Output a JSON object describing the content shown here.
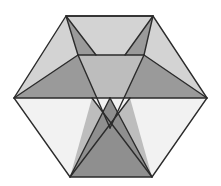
{
  "figure": {
    "name": "polyhedron-wireframe-figure",
    "canvas": {
      "width": 221,
      "height": 186,
      "background": "#ffffff"
    },
    "palette": {
      "outline": "#2b2b2b",
      "lightest": "#f2f2f2",
      "light": "#d3d3d3",
      "mid": "#bdbdbd",
      "medium": "#9a9a9a",
      "dark": "#8f8f8f"
    },
    "stroke_width": 1.4,
    "vertices": {
      "hex_top_left": [
        66,
        16
      ],
      "hex_top_right": [
        153,
        16
      ],
      "hex_right": [
        207,
        98
      ],
      "hex_bottom_right": [
        152,
        177
      ],
      "hex_bottom_left": [
        70,
        177
      ],
      "hex_left": [
        14,
        98
      ],
      "inner_top_left": [
        78,
        55
      ],
      "inner_top_right": [
        144,
        55
      ],
      "center_cross": [
        110,
        128
      ],
      "apex_low_left": [
        92,
        150
      ],
      "apex_low_right": [
        130,
        150
      ]
    },
    "facets": [
      {
        "name": "top-panel",
        "tone": "light",
        "points": "66,16 153,16 144,55 78,55"
      },
      {
        "name": "top-left-wedge",
        "tone": "medium",
        "points": "66,16 78,55 96,55"
      },
      {
        "name": "top-right-wedge",
        "tone": "medium",
        "points": "153,16 125,55 144,55"
      },
      {
        "name": "upper-left-face",
        "tone": "light",
        "points": "66,16 14,98 78,55"
      },
      {
        "name": "upper-right-face",
        "tone": "light",
        "points": "153,16 144,55 207,98"
      },
      {
        "name": "left-wing-triangle",
        "tone": "medium",
        "points": "14,98 78,55 110,98"
      },
      {
        "name": "right-wing-triangle",
        "tone": "medium",
        "points": "207,98 144,55 110,98"
      },
      {
        "name": "center-upper-triangle",
        "tone": "mid",
        "points": "78,55 144,55 110,128"
      },
      {
        "name": "lower-left-face",
        "tone": "lightest",
        "points": "14,98 110,98 70,177"
      },
      {
        "name": "lower-right-face",
        "tone": "lightest",
        "points": "207,98 110,98 152,177"
      },
      {
        "name": "left-cross-blade",
        "tone": "mid",
        "points": "92,98 130,150 70,177"
      },
      {
        "name": "right-cross-blade",
        "tone": "mid",
        "points": "130,98 92,150 152,177"
      },
      {
        "name": "bottom-dark-triangle",
        "tone": "dark",
        "points": "110,98 152,177 70,177"
      }
    ],
    "edges": [
      {
        "name": "hex-outline",
        "points": "66,16 153,16 207,98 152,177 70,177 14,98 66,16"
      },
      {
        "name": "top-panel-outline",
        "points": "66,16 153,16 144,55 78,55 66,16"
      },
      {
        "name": "edge-topleft-to-inner",
        "points": "66,16 96,55"
      },
      {
        "name": "edge-topright-to-inner",
        "points": "153,16 125,55"
      },
      {
        "name": "edge-left-to-innerleft",
        "points": "14,98 78,55"
      },
      {
        "name": "edge-right-to-innerright",
        "points": "207,98 144,55"
      },
      {
        "name": "edge-innerleft-to-center",
        "points": "78,55 110,128"
      },
      {
        "name": "edge-innerright-to-center",
        "points": "144,55 110,128"
      },
      {
        "name": "edge-left-to-centerline",
        "points": "14,98 110,98"
      },
      {
        "name": "edge-right-to-centerline",
        "points": "207,98 110,98"
      },
      {
        "name": "edge-cross-left",
        "points": "92,98 152,177"
      },
      {
        "name": "edge-cross-right",
        "points": "130,98 70,177"
      },
      {
        "name": "edge-bottom-left-rise",
        "points": "70,177 110,98"
      },
      {
        "name": "edge-bottom-right-rise",
        "points": "152,177 110,98"
      }
    ]
  }
}
